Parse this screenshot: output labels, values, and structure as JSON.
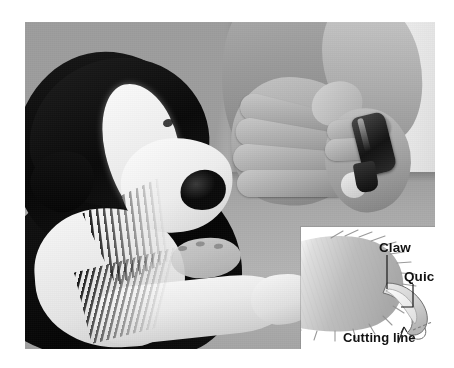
{
  "image": {
    "kind": "photograph-with-inset-diagram",
    "subject": "Trimming a dog's claws",
    "color_mode": "grayscale",
    "canvas": {
      "width": 454,
      "height": 368,
      "background": "#ffffff"
    },
    "photo_frame": {
      "left": 25,
      "top": 22,
      "width": 410,
      "height": 327
    }
  },
  "scene": {
    "description": "A black-and-white dog lies on a gray table while two human hands hold one paw and a nail clipper.",
    "elements": [
      {
        "name": "dog",
        "detail": "black and white dog resting head down, white blaze and muzzle, black ears"
      },
      {
        "name": "front-leg",
        "detail": "white foreleg and paw stretched across the table"
      },
      {
        "name": "hands",
        "detail": "pair of adult human hands cupping the dog's paw"
      },
      {
        "name": "nail-clipper",
        "detail": "dark handled nail clipper held in the right hand"
      },
      {
        "name": "table",
        "detail": "plain gray table surface"
      },
      {
        "name": "wall",
        "detail": "light neutral background wall"
      }
    ],
    "palette": {
      "dog_black": "#0a0a0a",
      "dog_white": "#f6f6f4",
      "table_gray": "#a9acaf",
      "wall_light": "#eeedea",
      "skin_gray": "#b2afaa",
      "clipper_dark": "#1a1a1a"
    }
  },
  "inset": {
    "title": "Claw cross-section diagram",
    "background": "#ffffff",
    "frame": {
      "left": 276,
      "top": 205,
      "width": 157,
      "height": 127
    },
    "labels": {
      "claw": "Claw",
      "quick": "Quick",
      "cutting_line": "Cutting line"
    },
    "parts": [
      {
        "name": "toe-pad",
        "fill": "#b9b9b7",
        "detail": "furred toe shown in profile with feathered hair edges"
      },
      {
        "name": "claw-horn",
        "fill": "#d8d8d6",
        "detail": "curved nail extending forward and down from the toe"
      },
      {
        "name": "quick-tissue",
        "fill": "#efeeec",
        "detail": "lighter wedge of living tissue inside the base of the claw"
      },
      {
        "name": "cutting-line-marker",
        "fill": "#8a8a88",
        "detail": "short dashed line across the claw tip, beyond the quick"
      }
    ],
    "leader_lines": [
      {
        "from": "claw",
        "to": "claw-horn"
      },
      {
        "from": "quick",
        "to": "quick-tissue"
      },
      {
        "from": "cutting_line",
        "to": "cutting-line-marker",
        "style": "arrow"
      }
    ]
  }
}
